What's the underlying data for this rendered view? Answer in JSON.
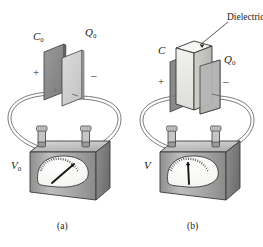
{
  "figure": {
    "background_color": "#ffffff",
    "ink_color": "#1a1a1a",
    "panels": [
      {
        "id": "a",
        "panel_label": "(a)",
        "capacitance_label": "C",
        "capacitance_subscript": "0",
        "charge_label": "Q",
        "charge_subscript": "0",
        "plus_sign": "+",
        "minus_sign": "–",
        "meter_label": "V",
        "meter_subscript": "0",
        "needle_reading": "high",
        "needle_angle_deg": -38,
        "has_dielectric": false,
        "plate_left_color": "#8a8a8a",
        "plate_right_color": "#cfcfcf"
      },
      {
        "id": "b",
        "panel_label": "(b)",
        "capacitance_label": "C",
        "capacitance_subscript": "",
        "charge_label": "Q",
        "charge_subscript": "0",
        "plus_sign": "+",
        "minus_sign": "–",
        "meter_label": "V",
        "meter_subscript": "",
        "needle_reading": "low",
        "needle_angle_deg": -2,
        "has_dielectric": true,
        "dielectric_callout": "Dielectric",
        "plate_left_color": "#8a8a8a",
        "plate_right_color": "#b3b3b3",
        "dielectric_color": "#e8e8e6"
      }
    ],
    "meter": {
      "dial_face_color": "#fdfdfb",
      "body_top_color": "#c9c9c9",
      "body_front_color": "#a8a8a8",
      "body_side_color": "#7e7e7e",
      "tick_count": 21,
      "terminal_count": 2
    },
    "wire": {
      "style": "double-line",
      "color": "#6b6b6b"
    }
  }
}
